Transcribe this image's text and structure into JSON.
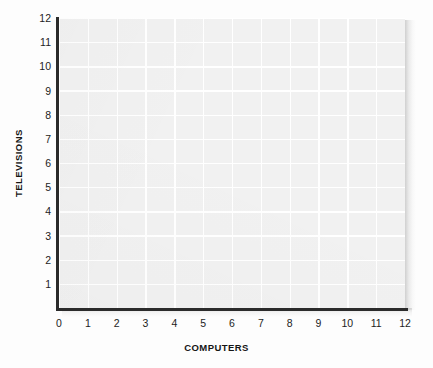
{
  "chart_data": {
    "type": "scatter",
    "title": "",
    "subtitle": "",
    "xlabel": "COMPUTERS",
    "ylabel": "TELEVISIONS",
    "xlim": [
      0,
      12
    ],
    "ylim": [
      0,
      12
    ],
    "x_tick_labels": [
      "0",
      "1",
      "2",
      "3",
      "4",
      "5",
      "6",
      "7",
      "8",
      "9",
      "10",
      "11",
      "12"
    ],
    "y_tick_labels": [
      "1",
      "2",
      "3",
      "4",
      "5",
      "6",
      "7",
      "8",
      "9",
      "10",
      "11",
      "12"
    ],
    "x_ticks": [
      0,
      1,
      2,
      3,
      4,
      5,
      6,
      7,
      8,
      9,
      10,
      11,
      12
    ],
    "y_ticks": [
      1,
      2,
      3,
      4,
      5,
      6,
      7,
      8,
      9,
      10,
      11,
      12
    ],
    "grid": true,
    "grid_color": "#ffffff",
    "plot_background": "#f1f1f1",
    "axis_color": "#2b2b2b",
    "legend": null,
    "legend_position": "none",
    "annotations": [],
    "series": [
      {
        "name": "",
        "x": [],
        "y": [],
        "values": []
      }
    ],
    "note": "empty plotting grid - no data points plotted"
  },
  "figure": {
    "background": "#fdfdfd"
  }
}
